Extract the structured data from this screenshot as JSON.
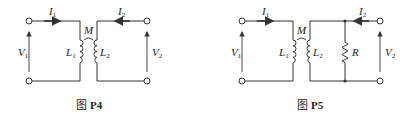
{
  "figures": [
    {
      "id": "P4",
      "caption_prefix": "图",
      "caption_label": "P4",
      "labels": {
        "I1": "I",
        "I1_sub": "1",
        "I2": "I",
        "I2_sub": "2",
        "V1": "V",
        "V1_sub": "1",
        "V2": "V",
        "V2_sub": "2",
        "L1": "L",
        "L1_sub": "1",
        "L2": "L",
        "L2_sub": "2",
        "M": "M"
      }
    },
    {
      "id": "P5",
      "caption_prefix": "图",
      "caption_label": "P5",
      "labels": {
        "I1": "I",
        "I1_sub": "1",
        "I2": "I",
        "I2_sub": "2",
        "V1": "V",
        "V1_sub": "1",
        "V2": "V",
        "V2_sub": "2",
        "L1": "L",
        "L1_sub": "1",
        "L2": "L",
        "L2_sub": "2",
        "M": "M",
        "R": "R"
      }
    }
  ]
}
